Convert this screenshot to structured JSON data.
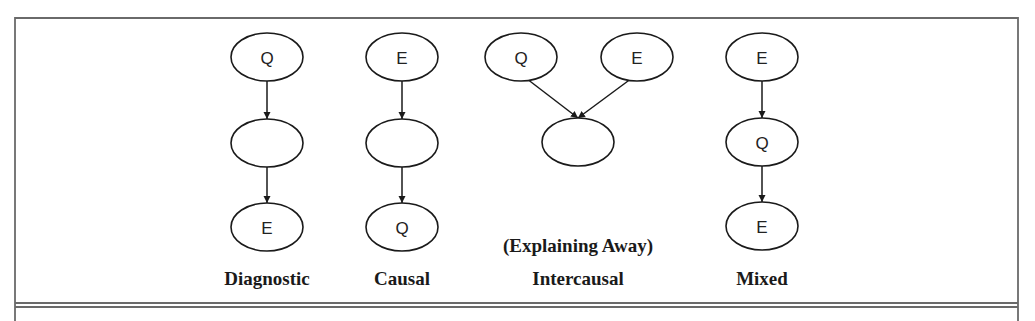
{
  "figure": {
    "frame": {
      "left": 15,
      "top": 18,
      "right": 1018,
      "bottom_rule_y1": 303,
      "bottom_rule_y2": 307
    },
    "columns": [
      {
        "id": "diagnostic",
        "label": "Diagnostic",
        "sublabel": "",
        "nodes": [
          {
            "id": "d1",
            "text": "Q",
            "cx": 267,
            "cy": 57
          },
          {
            "id": "d2",
            "text": "",
            "cx": 267,
            "cy": 143
          },
          {
            "id": "d3",
            "text": "E",
            "cx": 267,
            "cy": 227
          }
        ],
        "edges": [
          [
            "d1",
            "d2"
          ],
          [
            "d2",
            "d3"
          ]
        ],
        "label_x": 267
      },
      {
        "id": "causal",
        "label": "Causal",
        "sublabel": "",
        "nodes": [
          {
            "id": "c1",
            "text": "E",
            "cx": 402,
            "cy": 57
          },
          {
            "id": "c2",
            "text": "",
            "cx": 402,
            "cy": 143
          },
          {
            "id": "c3",
            "text": "Q",
            "cx": 402,
            "cy": 227
          }
        ],
        "edges": [
          [
            "c1",
            "c2"
          ],
          [
            "c2",
            "c3"
          ]
        ],
        "label_x": 402
      },
      {
        "id": "intercausal",
        "label": "Intercausal",
        "sublabel": "(Explaining Away)",
        "nodes": [
          {
            "id": "i1",
            "text": "Q",
            "cx": 521,
            "cy": 57
          },
          {
            "id": "i2",
            "text": "E",
            "cx": 637,
            "cy": 57
          },
          {
            "id": "i3",
            "text": "",
            "cx": 578,
            "cy": 142
          }
        ],
        "edges": [
          [
            "i1",
            "i3"
          ],
          [
            "i2",
            "i3"
          ]
        ],
        "label_x": 578
      },
      {
        "id": "mixed",
        "label": "Mixed",
        "sublabel": "",
        "nodes": [
          {
            "id": "m1",
            "text": "E",
            "cx": 762,
            "cy": 57
          },
          {
            "id": "m2",
            "text": "Q",
            "cx": 762,
            "cy": 142
          },
          {
            "id": "m3",
            "text": "E",
            "cx": 762,
            "cy": 226
          }
        ],
        "edges": [
          [
            "m1",
            "m2"
          ],
          [
            "m2",
            "m3"
          ]
        ],
        "label_x": 762
      }
    ],
    "node_rx": 36,
    "node_ry": 24,
    "label_y": 285,
    "sublabel_y": 252,
    "colors": {
      "stroke": "#1a1a1a",
      "frame": "#6a6a6a",
      "background": "#ffffff"
    }
  }
}
